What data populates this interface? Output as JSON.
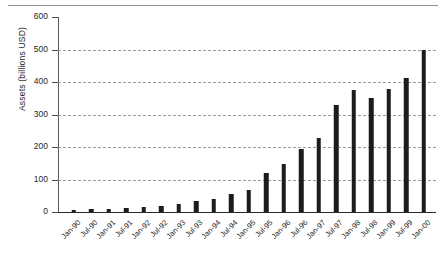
{
  "chart_data": {
    "type": "bar",
    "title": "",
    "xlabel": "",
    "ylabel": "Assets (billions USD)",
    "ylim": [
      0,
      600
    ],
    "yticks": [
      0,
      100,
      200,
      300,
      400,
      500,
      600
    ],
    "ytick_labels": [
      "0",
      "100",
      "200",
      "300",
      "400",
      "500",
      "600"
    ],
    "grid": true,
    "legend": false,
    "categories": [
      "Jan-90",
      "Jul-90",
      "Jan-91",
      "Jul-91",
      "Jan-92",
      "Jul-92",
      "Jan-93",
      "Jul-93",
      "Jan-94",
      "Jul-94",
      "Jan-95",
      "Jul-95",
      "Jan-96",
      "Jul-96",
      "Jan-97",
      "Jul-97",
      "Jan-98",
      "Jul-98",
      "Jan-99",
      "Jul-99",
      "Jan-00"
    ],
    "values": [
      5,
      8,
      10,
      13,
      16,
      20,
      25,
      33,
      40,
      55,
      68,
      120,
      148,
      195,
      228,
      330,
      375,
      352,
      378,
      412,
      500
    ],
    "bar_color": "#1c1c1c"
  }
}
